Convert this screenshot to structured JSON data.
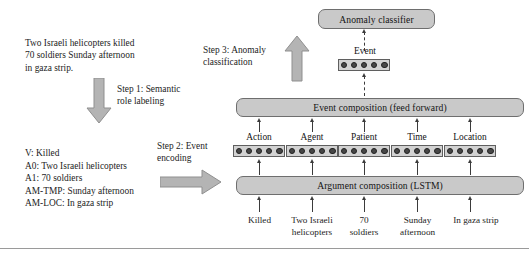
{
  "figure": {
    "input_sentence": "Two Israeli helicopters killed\n70 soldiers Sunday afternoon\nin gaza strip.",
    "srl_output": "V: Killed\nA0: Two Israeli helicopters\nA1: 70 soldiers\nAM-TMP: Sunday afternoon\nAM-LOC: In gaza strip",
    "steps": {
      "step1": "Step 1: Semantic\nrole labeling",
      "step2": "Step 2: Event\nencoding",
      "step3": "Step 3: Anomaly\nclassification"
    },
    "boxes": {
      "anomaly_classifier": "Anomaly classifier",
      "event_composition": "Event composition (feed forward)",
      "argument_composition": "Argument composition (LSTM)"
    },
    "event_vector_label": "Event",
    "roles": [
      {
        "label": "Action",
        "word": "Killed"
      },
      {
        "label": "Agent",
        "word": "Two Israeli\nhelicopters"
      },
      {
        "label": "Patient",
        "word": "70\nsoldiers"
      },
      {
        "label": "Time",
        "word": "Sunday\nafternoon"
      },
      {
        "label": "Location",
        "word": "In gaza strip"
      }
    ],
    "vector_dots": 5,
    "colors": {
      "box_fill": "#c9c9c9",
      "box_stroke": "#6e6e6e",
      "vector_fill": "#d2d2d2",
      "dot_fill": "#474747",
      "arrow_fill": "#b4b4b4",
      "arrow_stroke": "#8a8a8a",
      "connector": "#3b3b3b",
      "rule": "#9a9a9a",
      "background": "#ffffff"
    }
  }
}
